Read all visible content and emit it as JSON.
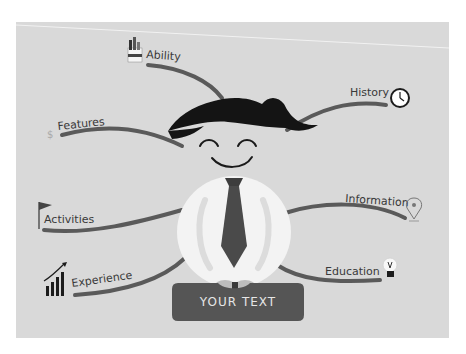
{
  "diagram": {
    "type": "mind-map-infographic",
    "central_figure": "smiling businessman with tie",
    "banner_text": "YOUR TEXT",
    "branches": [
      {
        "label": "Ability",
        "icon": "paint-brushes-icon",
        "side": "left"
      },
      {
        "label": "Features",
        "icon": "dollar-icon",
        "side": "left"
      },
      {
        "label": "Activities",
        "icon": "flag-icon",
        "side": "left"
      },
      {
        "label": "Experience",
        "icon": "growth-chart-icon",
        "side": "left"
      },
      {
        "label": "History",
        "icon": "clock-icon",
        "side": "right"
      },
      {
        "label": "Information",
        "icon": "map-pin-icon",
        "side": "right"
      },
      {
        "label": "Education",
        "icon": "lightbulb-icon",
        "side": "right"
      }
    ],
    "icon_glyphs": {
      "dollar": "$"
    }
  },
  "colors": {
    "background": "#d9d9d9",
    "branch_line": "#5a5a5a",
    "hair": "#121212",
    "shirt": "#f4f4f4",
    "tie": "#4a4a4a",
    "banner": "#555555",
    "banner_text": "#e6e6e6",
    "label_text": "#3a3a3a"
  }
}
